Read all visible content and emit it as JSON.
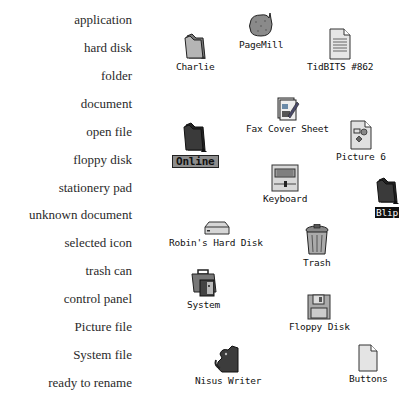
{
  "legend": [
    "application",
    "hard disk",
    "folder",
    "document",
    "open file",
    "floppy disk",
    "stationery pad",
    "unknown document",
    "selected icon",
    "trash can",
    "control panel",
    "Picture file",
    "System file",
    "ready to rename"
  ],
  "icons": {
    "pagemill": {
      "label": "PageMill",
      "icon": "application-icon"
    },
    "charlie": {
      "label": "Charlie",
      "icon": "folder-icon"
    },
    "tidbits": {
      "label": "TidBITS #862",
      "icon": "document-icon"
    },
    "fax": {
      "label": "Fax Cover Sheet",
      "icon": "stationery-pad-icon"
    },
    "online": {
      "label": "Online",
      "icon": "folder-icon",
      "state": "ready to rename"
    },
    "picture6": {
      "label": "Picture 6",
      "icon": "picture-file-icon"
    },
    "blip": {
      "label": "Blip",
      "icon": "folder-icon",
      "state": "selected"
    },
    "keyboard": {
      "label": "Keyboard",
      "icon": "control-panel-icon"
    },
    "robin": {
      "label": "Robin's Hard Disk",
      "icon": "hard-disk-icon"
    },
    "trash": {
      "label": "Trash",
      "icon": "trash-can-icon"
    },
    "system": {
      "label": "System",
      "icon": "system-file-icon"
    },
    "floppy": {
      "label": "Floppy Disk",
      "icon": "floppy-disk-icon"
    },
    "nisus": {
      "label": "Nisus Writer",
      "icon": "application-icon"
    },
    "buttons": {
      "label": "Buttons",
      "icon": "unknown-document-icon"
    }
  },
  "colors": {
    "selected_bg": "#111111",
    "rename_bg": "#8d8d8d"
  }
}
